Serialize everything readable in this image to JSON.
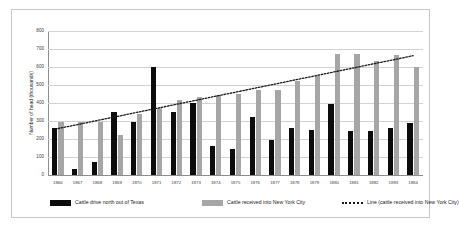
{
  "chart_data": {
    "type": "bar",
    "title": "",
    "xlabel": "",
    "ylabel": "Number of head (thousands)",
    "ylim": [
      0,
      800
    ],
    "ytick_step": 100,
    "yticks": [
      0,
      100,
      200,
      300,
      400,
      500,
      600,
      700,
      800
    ],
    "grid": true,
    "legend_position": "bottom",
    "categories": [
      "1866",
      "1867",
      "1868",
      "1869",
      "1870",
      "1871",
      "1872",
      "1873",
      "1874",
      "1875",
      "1876",
      "1877",
      "1878",
      "1879",
      "1880",
      "1881",
      "1882",
      "1883",
      "1884"
    ],
    "series": [
      {
        "name": "Cattle drive north out of Texas",
        "type": "bar",
        "color": "#0c0c0c",
        "values": [
          260,
          35,
          75,
          350,
          295,
          600,
          348,
          400,
          163,
          147,
          320,
          196,
          263,
          252,
          392,
          244,
          244,
          260,
          290
        ]
      },
      {
        "name": "Cattle received into New York City",
        "type": "bar",
        "color": "#a6a6a6",
        "values": [
          295,
          295,
          295,
          225,
          340,
          375,
          415,
          432,
          447,
          450,
          470,
          472,
          520,
          552,
          670,
          672,
          632,
          665,
          602
        ]
      },
      {
        "name": "Line (cattle received into New York City)",
        "type": "line",
        "style": "dotted",
        "color": "#1a1a1a",
        "values": [
          258,
          280,
          303,
          325,
          348,
          370,
          393,
          415,
          438,
          460,
          483,
          505,
          528,
          550,
          573,
          595,
          618,
          640,
          663
        ]
      }
    ]
  },
  "legend": {
    "items": [
      {
        "label": "Cattle drive north out of Texas",
        "swatch": "solid-black"
      },
      {
        "label": "Cattle received into New York City",
        "swatch": "solid-gray"
      },
      {
        "label": "Line (cattle received into New York City)",
        "swatch": "dotted"
      }
    ]
  }
}
